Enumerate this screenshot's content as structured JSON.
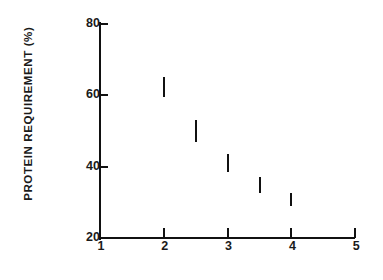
{
  "chart_data": {
    "type": "scatter",
    "title": "",
    "subtitle": "",
    "xlabel": "",
    "ylabel": "PROTEIN  REQUIREMENT (%)",
    "xlim": [
      1,
      5
    ],
    "ylim": [
      20,
      80
    ],
    "grid": false,
    "legend": null,
    "x_ticks": [
      {
        "value": 1,
        "label": "1"
      },
      {
        "value": 2,
        "label": "2"
      },
      {
        "value": 3,
        "label": "3"
      },
      {
        "value": 4,
        "label": "4"
      },
      {
        "value": 5,
        "label": "5"
      }
    ],
    "y_ticks": [
      {
        "value": 80,
        "label": "80"
      },
      {
        "value": 60,
        "label": "60"
      },
      {
        "value": 40,
        "label": "40"
      },
      {
        "value": 20,
        "label": "20"
      }
    ],
    "marker_style": "vertical-range-bar",
    "x": [
      2,
      2.5,
      3,
      3.5,
      4
    ],
    "values": [
      62,
      50,
      41,
      35,
      31
    ],
    "y_low": [
      59.5,
      47,
      38.5,
      32.5,
      29
    ],
    "y_high": [
      65,
      53,
      43.5,
      37,
      32.5
    ],
    "points": [
      {
        "x": 2,
        "y": 62,
        "y_low": 59.5,
        "y_high": 65
      },
      {
        "x": 2.5,
        "y": 50,
        "y_low": 47,
        "y_high": 53
      },
      {
        "x": 3,
        "y": 41,
        "y_low": 38.5,
        "y_high": 43.5
      },
      {
        "x": 3.5,
        "y": 35,
        "y_low": 32.5,
        "y_high": 37
      },
      {
        "x": 4,
        "y": 31,
        "y_low": 29,
        "y_high": 32.5
      }
    ],
    "colors": {
      "axis": "#111111",
      "marker": "#111111",
      "background": "#ffffff",
      "text": "#1a1a1a"
    },
    "geometry": {
      "x_origin_px": 100,
      "x_end_px": 355,
      "y_origin_px": 238,
      "y_top_px": 24,
      "px_per_x_unit": 63.8,
      "px_per_y_unit": 3.567
    }
  }
}
